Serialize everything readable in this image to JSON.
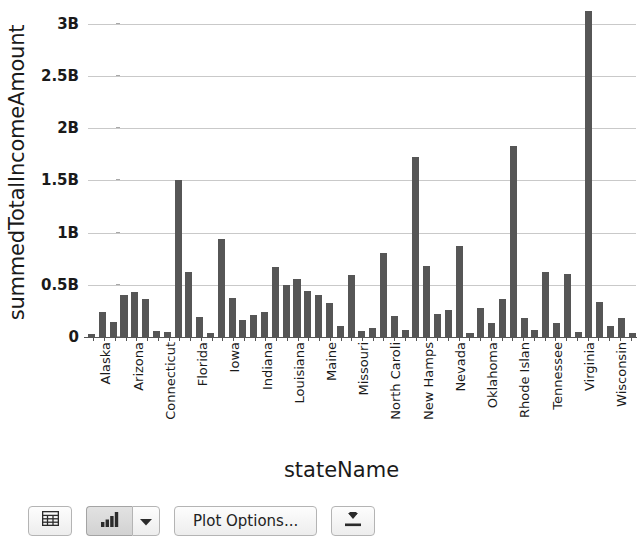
{
  "chart_data": {
    "type": "bar",
    "title": "",
    "xlabel": "stateName",
    "ylabel": "summedTotalIncomeAmount",
    "ylim": [
      0,
      3.15
    ],
    "y_unit": "B",
    "grid": true,
    "legend": "none",
    "bar_color": "#565656",
    "y_ticks": [
      {
        "label": "0",
        "value": 0
      },
      {
        "label": "0.5B",
        "value": 0.5
      },
      {
        "label": "1B",
        "value": 1.0
      },
      {
        "label": "1.5B",
        "value": 1.5
      },
      {
        "label": "2B",
        "value": 2.0
      },
      {
        "label": "2.5B",
        "value": 2.5
      },
      {
        "label": "3B",
        "value": 3.0
      }
    ],
    "tick_label_interval": 3,
    "categories": [
      "Alaska",
      "Alabama",
      "Arkansas",
      "Arizona",
      "California",
      "Colorado",
      "Connecticut",
      "Delaware",
      "Florida",
      "Florida",
      "Georgia",
      "Hawaii",
      "Iowa",
      "Idaho",
      "Illinois",
      "Indiana",
      "Kansas",
      "Kentucky",
      "Louisiana",
      "Massachusett",
      "Maryland",
      "Maine",
      "Michigan",
      "Minnesota",
      "Missouri",
      "Mississippi",
      "Montana",
      "North Caroli",
      "North Dakota",
      "Nebraska",
      "New Hamps",
      "New Jersey",
      "New Mexico",
      "Nevada",
      "New York",
      "Ohio",
      "Oklahoma",
      "Oregon",
      "Pennsylvania",
      "Rhode Islan",
      "South Caroli",
      "South Dakota",
      "Tennessee",
      "Texas",
      "Utah",
      "Virginia",
      "Vermont",
      "Washington",
      "Wisconsin",
      "West Virginia",
      "Wyoming"
    ],
    "visible_tick_labels": [
      "Alaska",
      "Arizona",
      "Connecticut",
      "Florida",
      "Iowa",
      "Indiana",
      "Louisiana",
      "Maine",
      "Missouri",
      "North Caroli",
      "New Hamps",
      "Nevada",
      "Oklahoma",
      "Rhode Islan",
      "Tennessee",
      "Virginia",
      "Wisconsin"
    ],
    "values": [
      0.03,
      0.24,
      0.14,
      0.4,
      0.43,
      0.36,
      0.06,
      0.05,
      1.5,
      0.62,
      0.19,
      0.04,
      0.94,
      0.37,
      0.16,
      0.21,
      0.24,
      0.67,
      0.5,
      0.56,
      0.44,
      0.4,
      0.33,
      0.11,
      0.59,
      0.06,
      0.09,
      0.8,
      0.2,
      0.07,
      1.72,
      0.68,
      0.22,
      0.26,
      0.87,
      0.04,
      0.28,
      0.13,
      0.36,
      1.83,
      0.18,
      0.07,
      0.62,
      0.13,
      0.6,
      0.05,
      3.12,
      0.34,
      0.11,
      0.18,
      0.04
    ]
  },
  "toolbar": {
    "table_button": {
      "icon": "table-grid-icon",
      "label": ""
    },
    "chart_button": {
      "icon": "bar-chart-icon",
      "label": "",
      "pressed": true
    },
    "chart_menu_button": {
      "icon": "chevron-down-icon",
      "label": ""
    },
    "plot_options_button": {
      "label": "Plot Options..."
    },
    "export_button": {
      "icon": "download-icon",
      "label": ""
    }
  }
}
